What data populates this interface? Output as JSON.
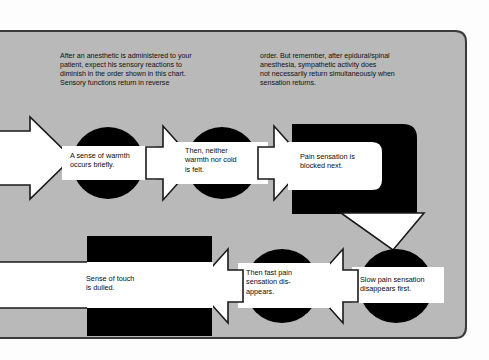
{
  "panel": {
    "background_color": "#b9b9b9",
    "border_color": "#3a3a3a",
    "outside_color": "#fdfdfd"
  },
  "intro": {
    "left_column": [
      "After an anesthetic is administered to your",
      "patient, expect his sensory reactions to",
      "diminish in the order shown in this chart.",
      "Sensory functions return in reverse"
    ],
    "right_column": [
      "order. But remember, after epidural/spinal",
      "anesthesia, sympathetic activity does",
      "not necessarily return simultaneously when",
      "sensation returns."
    ]
  },
  "flow": {
    "direction_top": "left-to-right",
    "direction_bottom": "right-to-left",
    "nodes": [
      {
        "id": "node-warmth",
        "shape": "circle",
        "lines": [
          "A sense of warmth",
          "occurs briefly."
        ]
      },
      {
        "id": "node-neither-warmth-nor-cold",
        "shape": "circle",
        "lines": [
          "Then, neither",
          "warmth nor cold",
          "is felt."
        ]
      },
      {
        "id": "node-pain-blocked",
        "shape": "rounded-hook",
        "lines": [
          "Pain sensation is",
          "blocked next."
        ]
      },
      {
        "id": "node-slow-pain",
        "shape": "circle",
        "lines": [
          "Slow pain sensation",
          "disappears first."
        ]
      },
      {
        "id": "node-fast-pain",
        "shape": "circle",
        "lines": [
          "Then fast pain",
          "sensation dis-",
          "appears."
        ]
      },
      {
        "id": "node-touch-dulled",
        "shape": "rectangle",
        "lines": [
          "Sense of touch",
          "is dulled."
        ]
      }
    ],
    "arrows": [
      {
        "id": "arrow-entry",
        "direction": "right"
      },
      {
        "id": "arrow-warmth-to-cold",
        "direction": "right"
      },
      {
        "id": "arrow-cold-to-pain",
        "direction": "right"
      },
      {
        "id": "arrow-pain-to-slow",
        "direction": "down"
      },
      {
        "id": "arrow-slow-to-fast",
        "direction": "left"
      },
      {
        "id": "arrow-fast-to-touch",
        "direction": "left"
      }
    ]
  }
}
